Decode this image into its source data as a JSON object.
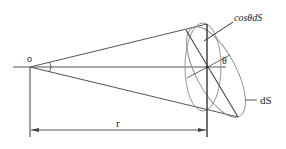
{
  "diagram": {
    "type": "solid-angle-cone",
    "labels": {
      "origin": "o",
      "distance": "r",
      "angle": "θ",
      "projected_area": "cosθdS",
      "area": "dS"
    },
    "colors": {
      "line": "#555555",
      "thick_line": "#333333",
      "ellipse": "#888888",
      "text": "#222222",
      "background": "#ffffff"
    }
  }
}
